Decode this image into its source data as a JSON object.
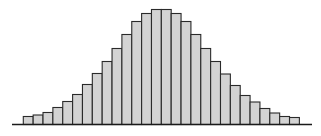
{
  "chart_data": {
    "type": "bar",
    "title": "",
    "xlabel": "",
    "ylabel": "",
    "grid": false,
    "legend": null,
    "style": {
      "bar_fill": "#d3d3d3",
      "bar_edge": "#2a2a2a",
      "axis_color": "#1a1a1a"
    },
    "categories": [
      "1",
      "2",
      "3",
      "4",
      "5",
      "6",
      "7",
      "8",
      "9",
      "10",
      "11",
      "12",
      "13",
      "14",
      "15",
      "16",
      "17",
      "18",
      "19",
      "20",
      "21",
      "22",
      "23",
      "24",
      "25",
      "26",
      "27",
      "28"
    ],
    "values": [
      8,
      9.5,
      12,
      17,
      23,
      30,
      40,
      51,
      63,
      76,
      90,
      103,
      111,
      115,
      115,
      111,
      103,
      90,
      76,
      63,
      50.5,
      39,
      29,
      22.5,
      16,
      11.5,
      8,
      7
    ],
    "ylim": [
      0,
      120
    ]
  }
}
